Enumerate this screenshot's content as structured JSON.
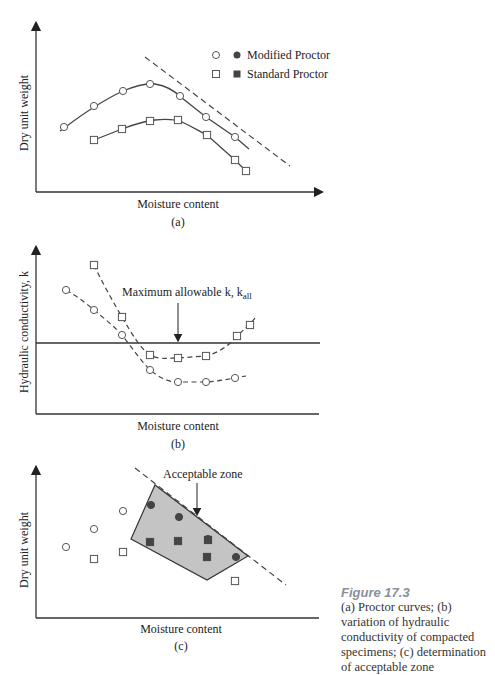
{
  "chart_data": [
    {
      "id": "a",
      "type": "line",
      "panel_label": "(a)",
      "title": "Proctor curves",
      "xlabel": "Moisture content",
      "ylabel": "Dry unit weight",
      "axes_box": {
        "x0": 36,
        "y0": 192,
        "x1": 320,
        "y1": 25
      },
      "legend": [
        {
          "open_marker": "circle",
          "filled_marker": "circle",
          "label": "Modified Proctor"
        },
        {
          "open_marker": "square",
          "filled_marker": "square",
          "label": "Standard Proctor"
        }
      ],
      "series": [
        {
          "name": "Modified Proctor",
          "marker": "circle",
          "line": "solid",
          "points": [
            [
              64,
              127
            ],
            [
              94,
              106
            ],
            [
              123,
              91
            ],
            [
              150,
              84
            ],
            [
              180,
              96
            ],
            [
              206,
              117
            ],
            [
              235,
              137
            ]
          ],
          "curve_ext": [
            [
              60,
              131
            ],
            [
              249,
              149
            ]
          ]
        },
        {
          "name": "Standard Proctor",
          "marker": "square",
          "line": "solid",
          "points": [
            [
              94,
              140
            ],
            [
              122,
              129
            ],
            [
              150,
              121
            ],
            [
              178,
              120
            ],
            [
              207,
              135
            ],
            [
              235,
              160
            ],
            [
              246,
              171
            ]
          ]
        },
        {
          "name": "Zero-air-voids line",
          "marker": "none",
          "line": "dashed",
          "points": [
            [
              145,
              57
            ],
            [
              290,
              166
            ]
          ]
        }
      ]
    },
    {
      "id": "b",
      "type": "line",
      "panel_label": "(b)",
      "title": "Variation of hydraulic conductivity of compacted specimens",
      "xlabel": "Moisture content",
      "ylabel": "Hydraulic conductivity, k",
      "axes_box": {
        "x0": 36,
        "y0": 414,
        "x1": 320,
        "y1": 250
      },
      "annotation": {
        "text": "Maximum allowable k, k",
        "subscript": "all",
        "arrow_from": [
          178,
          303
        ],
        "arrow_to": [
          178,
          343
        ]
      },
      "hline": {
        "y": 343,
        "label": "k_all"
      },
      "series": [
        {
          "name": "Modified Proctor k",
          "marker": "circle",
          "line": "dashed",
          "points": [
            [
              66,
              290
            ],
            [
              94,
              310
            ],
            [
              122,
              335
            ],
            [
              150,
              370
            ],
            [
              178,
              382
            ],
            [
              206,
              382
            ],
            [
              235,
              378
            ]
          ],
          "curve_ext": [
            [
              246,
              376
            ]
          ]
        },
        {
          "name": "Standard Proctor k",
          "marker": "square",
          "line": "dashed",
          "points": [
            [
              94,
              265
            ],
            [
              122,
              317
            ],
            [
              150,
              355
            ],
            [
              178,
              358
            ],
            [
              206,
              356
            ],
            [
              237,
              336
            ],
            [
              250,
              325
            ]
          ],
          "curve_ext": [
            [
              255,
              318
            ]
          ]
        }
      ]
    },
    {
      "id": "c",
      "type": "scatter",
      "panel_label": "(c)",
      "title": "Determination of acceptable zone",
      "xlabel": "Moisture content",
      "ylabel": "Dry unit weight",
      "axes_box": {
        "x0": 36,
        "y0": 618,
        "x1": 320,
        "y1": 468
      },
      "annotation": {
        "text": "Acceptable zone",
        "arrow_from": [
          197,
          486
        ],
        "arrow_to": [
          197,
          515
        ]
      },
      "zone_polygon": [
        [
          131,
          539
        ],
        [
          155,
          485
        ],
        [
          248,
          556
        ],
        [
          207,
          580
        ]
      ],
      "dashed_line": [
        [
          135,
          468
        ],
        [
          286,
          585
        ]
      ],
      "open_circles": [
        [
          66,
          547
        ],
        [
          94,
          529
        ],
        [
          123,
          511
        ]
      ],
      "open_squares": [
        [
          94,
          559
        ],
        [
          123,
          552
        ],
        [
          235,
          581
        ]
      ],
      "filled_circles": [
        [
          151,
          505
        ],
        [
          179,
          517
        ],
        [
          208,
          539
        ],
        [
          236,
          557
        ]
      ],
      "filled_squares": [
        [
          150,
          542
        ],
        [
          178,
          541
        ],
        [
          207,
          557
        ],
        [
          208,
          540
        ]
      ]
    }
  ],
  "caption": {
    "figure_label": "Figure 17.3",
    "text": "(a) Proctor curves; (b) variation of hydraulic conductivity of compacted specimens; (c) determination of acceptable zone"
  },
  "colors": {
    "ink": "#333333",
    "zone_fill": "#c4c4c4",
    "marker_fill_dark": "#444444",
    "caption_title": "#8a8f98"
  }
}
